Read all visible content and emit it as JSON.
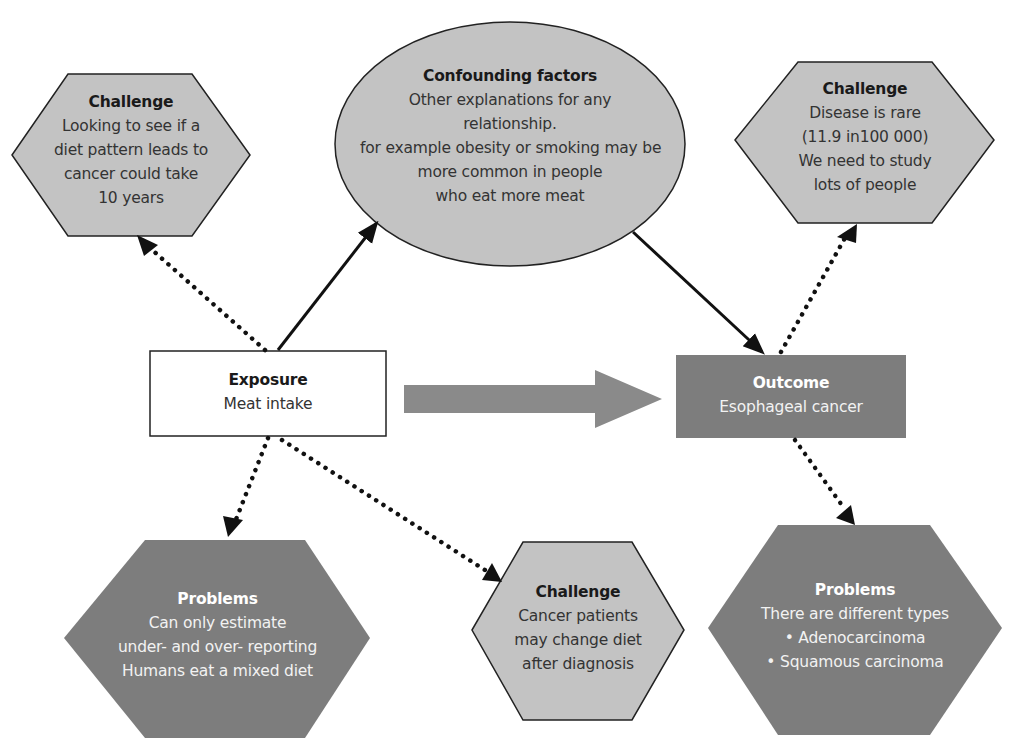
{
  "colors": {
    "light_fill": "#c3c3c3",
    "dark_fill": "#7d7d7d",
    "arrow_fill": "#8a8a8a",
    "stroke": "#111111",
    "white_box": "#ffffff"
  },
  "nodes": {
    "challenge_time": {
      "shape": "hexagon",
      "title": "Challenge",
      "lines": [
        "Looking to see if a",
        "diet pattern leads to",
        "cancer could take",
        "10 years"
      ]
    },
    "confounding": {
      "shape": "ellipse",
      "title": "Confounding factors",
      "lines": [
        "Other explanations for any",
        "relationship.",
        "for example obesity or smoking may be",
        "more common in people",
        "who eat more meat"
      ]
    },
    "challenge_rare": {
      "shape": "hexagon",
      "title": "Challenge",
      "lines": [
        "Disease is rare",
        "(11.9 in100 000)",
        "We need to study",
        "lots of people"
      ]
    },
    "exposure": {
      "shape": "rectangle",
      "title": "Exposure",
      "lines": [
        "Meat intake"
      ]
    },
    "outcome": {
      "shape": "rectangle",
      "title": "Outcome",
      "lines": [
        "Esophageal cancer"
      ]
    },
    "problems_exposure": {
      "shape": "hexagon",
      "title": "Problems",
      "lines": [
        "Can only estimate",
        "under- and over- reporting",
        "Humans eat a mixed diet"
      ]
    },
    "challenge_diet_change": {
      "shape": "hexagon",
      "title": "Challenge",
      "lines": [
        "Cancer patients",
        "may change diet",
        "after diagnosis"
      ]
    },
    "problems_outcome": {
      "shape": "hexagon",
      "title": "Problems",
      "lines": [
        "There are different types",
        "• Adenocarcinoma",
        "• Squamous carcinoma"
      ]
    }
  },
  "edges": [
    {
      "from": "exposure",
      "to": "confounding",
      "style": "solid"
    },
    {
      "from": "confounding",
      "to": "outcome",
      "style": "solid"
    },
    {
      "from": "exposure",
      "to": "outcome",
      "style": "block-arrow"
    },
    {
      "from": "exposure",
      "to": "challenge_time",
      "style": "dotted"
    },
    {
      "from": "exposure",
      "to": "problems_exposure",
      "style": "dotted"
    },
    {
      "from": "exposure",
      "to": "challenge_diet_change",
      "style": "dotted"
    },
    {
      "from": "outcome",
      "to": "challenge_rare",
      "style": "dotted"
    },
    {
      "from": "outcome",
      "to": "problems_outcome",
      "style": "dotted"
    }
  ]
}
